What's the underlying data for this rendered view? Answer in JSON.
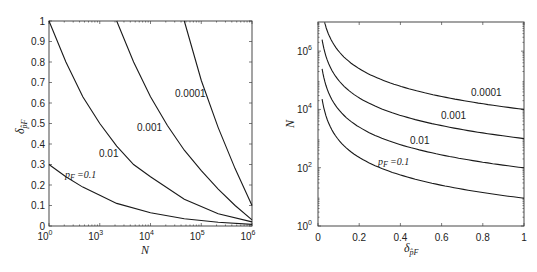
{
  "chart_data": [
    {
      "type": "line",
      "title": "",
      "xlabel": "N",
      "ylabel": "δ_{p̂F}",
      "x_scale": "log",
      "xlim": [
        1,
        1000000
      ],
      "ylim": [
        0,
        1
      ],
      "x_tick_labels": [
        {
          "base": "10",
          "exp": "0"
        },
        {
          "base": "10",
          "exp": "3"
        },
        {
          "base": "10",
          "exp": "4"
        },
        {
          "base": "10",
          "exp": "5"
        },
        {
          "base": "10",
          "exp": "6"
        }
      ],
      "y_tick_labels": [
        "0",
        "0.1",
        "0.2",
        "0.3",
        "0.4",
        "0.5",
        "0.6",
        "0.7",
        "0.8",
        "0.9",
        "1"
      ],
      "grid": false,
      "legend": "none (inline curve labels)",
      "series": [
        {
          "name": "p_F = 0.1",
          "label": "=0.1",
          "x_log10": [
            0,
            0.5,
            1,
            1.5,
            2,
            3,
            4,
            5,
            6
          ],
          "values": [
            0.3,
            0.24,
            0.19,
            0.15,
            0.11,
            0.065,
            0.035,
            0.018,
            0.008
          ]
        },
        {
          "name": "0.01",
          "label": "0.01",
          "x_log10": [
            0,
            0.5,
            1,
            1.5,
            2,
            2.5,
            3,
            4,
            5,
            6
          ],
          "values": [
            1.0,
            0.8,
            0.63,
            0.5,
            0.39,
            0.3,
            0.24,
            0.13,
            0.06,
            0.02
          ]
        },
        {
          "name": "0.001",
          "label": "0.001",
          "x_log10": [
            2,
            2.5,
            3,
            3.5,
            4,
            4.5,
            5,
            5.5,
            6
          ],
          "values": [
            1.0,
            0.8,
            0.63,
            0.49,
            0.37,
            0.27,
            0.18,
            0.1,
            0.03
          ]
        },
        {
          "name": "0.0001",
          "label": "0.0001",
          "x_log10": [
            4,
            4.5,
            5,
            5.5,
            6
          ],
          "values": [
            1.0,
            0.71,
            0.48,
            0.28,
            0.1
          ]
        }
      ]
    },
    {
      "type": "line",
      "title": "",
      "xlabel": "δ_{p̂F}",
      "ylabel": "N",
      "y_scale": "log",
      "xlim": [
        0,
        1
      ],
      "ylim": [
        1,
        10000000
      ],
      "x_tick_labels": [
        "0",
        "0.2",
        "0.4",
        "0.6",
        "0.8",
        "1"
      ],
      "y_tick_labels": [
        {
          "base": "10",
          "exp": "0"
        },
        {
          "base": "10",
          "exp": "2"
        },
        {
          "base": "10",
          "exp": "4"
        },
        {
          "base": "10",
          "exp": "6"
        }
      ],
      "grid": false,
      "legend": "none (inline curve labels)",
      "series": [
        {
          "name": "p_F = 0.1",
          "label": "=0.1",
          "x": [
            0.02,
            0.05,
            0.1,
            0.2,
            0.3,
            0.4,
            0.6,
            0.8,
            1.0
          ],
          "values": [
            22500,
            3600,
            900,
            225,
            100,
            56,
            25,
            14,
            9
          ]
        },
        {
          "name": "0.01",
          "label": "0.01",
          "x": [
            0.02,
            0.05,
            0.1,
            0.2,
            0.3,
            0.4,
            0.6,
            0.8,
            1.0
          ],
          "values": [
            247500,
            39600,
            9900,
            2475,
            1100,
            619,
            275,
            155,
            99
          ]
        },
        {
          "name": "0.001",
          "label": "0.001",
          "x": [
            0.02,
            0.05,
            0.1,
            0.2,
            0.3,
            0.4,
            0.6,
            0.8,
            1.0
          ],
          "values": [
            2497500,
            399600,
            99900,
            24975,
            11100,
            6244,
            2775,
            1561,
            999
          ]
        },
        {
          "name": "0.0001",
          "label": "0.0001",
          "x": [
            0.032,
            0.05,
            0.1,
            0.2,
            0.3,
            0.4,
            0.6,
            0.8,
            1.0
          ],
          "values": [
            9765000,
            3999600,
            999900,
            249975,
            111100,
            62494,
            27775,
            15623,
            9999
          ]
        }
      ]
    }
  ],
  "left_plot": {
    "xlabel": "N",
    "ylabel_main": "δ",
    "ylabel_sub": "p̂F",
    "curve_labels": {
      "pf_prefix": "p",
      "pf_sub": "F",
      "pf_value": "=0.1",
      "c2": "0.01",
      "c3": "0.001",
      "c4": "0.0001"
    }
  },
  "right_plot": {
    "xlabel_main": "δ",
    "xlabel_sub": "p̂F",
    "ylabel": "N",
    "curve_labels": {
      "pf_prefix": "p",
      "pf_sub": "F",
      "pf_value": "=0.1",
      "c2": "0.01",
      "c3": "0.001",
      "c4": "0.0001"
    }
  }
}
